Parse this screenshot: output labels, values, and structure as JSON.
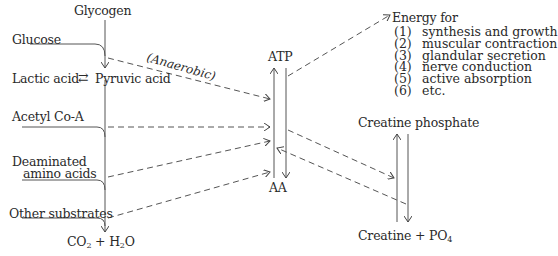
{
  "diagram": {
    "sources": {
      "glycogen": "Glycogen",
      "glucose": "Glucose",
      "lactic_acid": "Lactic acid",
      "reversible_arrow": "⇄",
      "pyruvic_acid": "Pyruvic acid",
      "acetyl_coa": "Acetyl Co-A",
      "deaminated_line1": "Deaminated",
      "deaminated_line2": "amino acids",
      "other_substrates": "Other substrates",
      "co2": "CO",
      "co2_sub": "2",
      "plus1": " + H",
      "h2o_sub": "2",
      "h2o_end": "O"
    },
    "anaerobic_label": "(Anaerobic)",
    "center": {
      "atp": "ATP",
      "aa": "AA"
    },
    "energy": {
      "title": "Energy for",
      "items": [
        {
          "num": "(1)",
          "text": "synthesis and growth"
        },
        {
          "num": "(2)",
          "text": "muscular contraction"
        },
        {
          "num": "(3)",
          "text": "glandular secretion"
        },
        {
          "num": "(4)",
          "text": "nerve conduction"
        },
        {
          "num": "(5)",
          "text": "active absorption"
        },
        {
          "num": "(6)",
          "text": "etc."
        }
      ]
    },
    "creatine": {
      "phosphate": "Creatine phosphate",
      "creatine": "Creatine",
      "plus_po": " + PO",
      "po_sub": "4"
    }
  }
}
